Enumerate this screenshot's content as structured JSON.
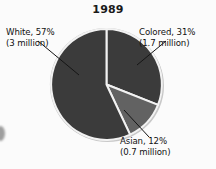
{
  "chart_data": {
    "type": "pie",
    "title": "1989",
    "xlabel": "",
    "ylabel": "",
    "legend_position": "callout-labels",
    "grid": false,
    "categories": [
      "Colored",
      "Asian",
      "White"
    ],
    "values": [
      31,
      12,
      57
    ],
    "units": "percent",
    "slices": [
      {
        "name": "Colored",
        "percent": 31,
        "percent_label": "31%",
        "absolute": 1.7,
        "absolute_label": "(1.7 million)",
        "label_line1": "Colored, 31%",
        "label_line2": "(1.7 million)",
        "color": "#3b3b3b",
        "start_angle_deg": 0,
        "end_angle_deg": 111.6
      },
      {
        "name": "Asian",
        "percent": 12,
        "percent_label": "12%",
        "absolute": 0.7,
        "absolute_label": "(0.7 million)",
        "label_line1": "Asian, 12%",
        "label_line2": "(0.7 million)",
        "color": "#626262",
        "start_angle_deg": 111.6,
        "end_angle_deg": 154.8
      },
      {
        "name": "White",
        "percent": 57,
        "percent_label": "57%",
        "absolute": 3,
        "absolute_label": "(3 million)",
        "label_line1": "White, 57%",
        "label_line2": "(3 million)",
        "color": "#3b3b3b",
        "start_angle_deg": 154.8,
        "end_angle_deg": 360
      }
    ]
  },
  "title": {
    "text": "1989"
  },
  "labels": {
    "white": {
      "line1": "White, 57%",
      "line2": "(3 million)"
    },
    "colored": {
      "line1": "Colored, 31%",
      "line2": "(1.7 million)"
    },
    "asian": {
      "line1": "Asian, 12%",
      "line2": "(0.7 million)"
    }
  },
  "colors": {
    "dark_slice": "#3b3b3b",
    "light_slice": "#626262",
    "separator": "#f2f2f2",
    "rim": "#bdbdbd",
    "text": "#111111",
    "background": "#fbfbfb"
  }
}
